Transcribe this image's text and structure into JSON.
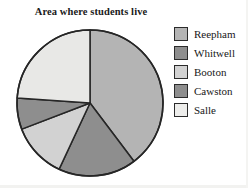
{
  "chart_data": {
    "type": "pie",
    "title": "Area where students live",
    "categories": [
      "Reepham",
      "Whitwell",
      "Booton",
      "Cawston",
      "Salle"
    ],
    "values": [
      39.7,
      17.2,
      12.2,
      7.0,
      23.9
    ],
    "units": "percent",
    "start_angle_deg": 0,
    "direction": "clockwise",
    "slice_boundaries_deg": [
      0,
      143,
      205,
      249,
      274,
      360
    ],
    "slice_colors": [
      "#b4b4b4",
      "#8e8e8e",
      "#d2d2d2",
      "#8e8e8e",
      "#e8e8e6"
    ],
    "slice_outline_color": "#262626",
    "legend_position": "right",
    "grid": false,
    "xlabel": "",
    "ylabel": "",
    "annotations": []
  },
  "legend": {
    "items": [
      {
        "label": "Reepham",
        "color": "#b4b4b4"
      },
      {
        "label": "Whitwell",
        "color": "#8e8e8e"
      },
      {
        "label": "Booton",
        "color": "#d2d2d2"
      },
      {
        "label": "Cawston",
        "color": "#8e8e8e"
      },
      {
        "label": "Salle",
        "color": "#ededeb"
      }
    ]
  },
  "colors": {
    "outline": "#262626",
    "text": "#181818",
    "background": "#ffffff"
  }
}
